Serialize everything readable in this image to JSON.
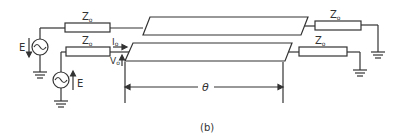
{
  "figure": {
    "caption": "(b)"
  },
  "labels": {
    "z_top_left": "Z",
    "z_top_left_sub": "o",
    "z_bottom_left": "Z",
    "z_bottom_left_sub": "o",
    "z_top_right": "Z",
    "z_top_right_sub": "o",
    "z_bottom_right": "Z",
    "z_bottom_right_sub": "o",
    "source_top": "E",
    "source_bottom": "E",
    "current": "I",
    "current_sub": "o",
    "voltage": "V",
    "voltage_sub": "o",
    "electrical_length": "θ"
  },
  "colors": {
    "stroke": "#333333",
    "background": "#ffffff"
  }
}
